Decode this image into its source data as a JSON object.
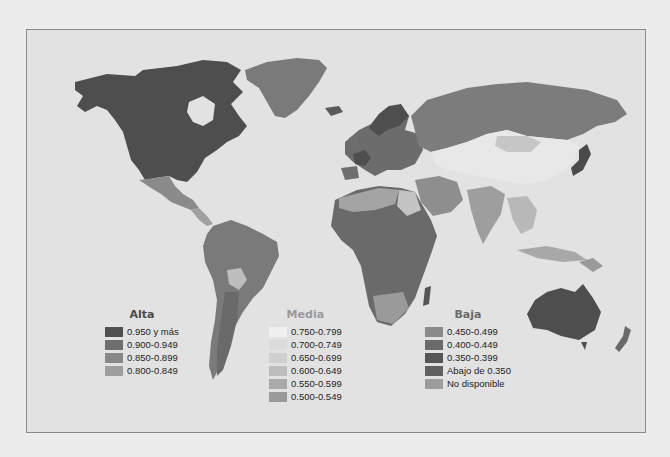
{
  "map": {
    "type": "choropleth",
    "subject": "world",
    "background_color": "#e2e2e2",
    "ocean_color": "#e2e2e2"
  },
  "legend": {
    "groups": [
      {
        "title": "Alta",
        "title_color": "#4a4a4a",
        "items": [
          {
            "label": "0.950 y más",
            "color": "#505050"
          },
          {
            "label": "0.900-0.949",
            "color": "#6e6e6e"
          },
          {
            "label": "0.850-0.899",
            "color": "#888888"
          },
          {
            "label": "0.800-0.849",
            "color": "#9e9e9e"
          }
        ]
      },
      {
        "title": "Media",
        "title_color": "#9a9a9a",
        "items": [
          {
            "label": "0.750-0.799",
            "color": "#f0f0f0"
          },
          {
            "label": "0.700-0.749",
            "color": "#dcdcdc"
          },
          {
            "label": "0.650-0.699",
            "color": "#cfcfcf"
          },
          {
            "label": "0.600-0.649",
            "color": "#bdbdbd"
          },
          {
            "label": "0.550-0.599",
            "color": "#aaaaaa"
          },
          {
            "label": "0.500-0.549",
            "color": "#9a9a9a"
          }
        ]
      },
      {
        "title": "Baja",
        "title_color": "#6a6a6a",
        "items": [
          {
            "label": "0.450-0.499",
            "color": "#8a8a8a"
          },
          {
            "label": "0.400-0.449",
            "color": "#6a6a6a"
          },
          {
            "label": "0.350-0.399",
            "color": "#555555"
          },
          {
            "label": "Abajo de 0.350",
            "color": "#606060"
          },
          {
            "label": "No disponible",
            "color": "#9c9c9c"
          }
        ]
      }
    ]
  }
}
